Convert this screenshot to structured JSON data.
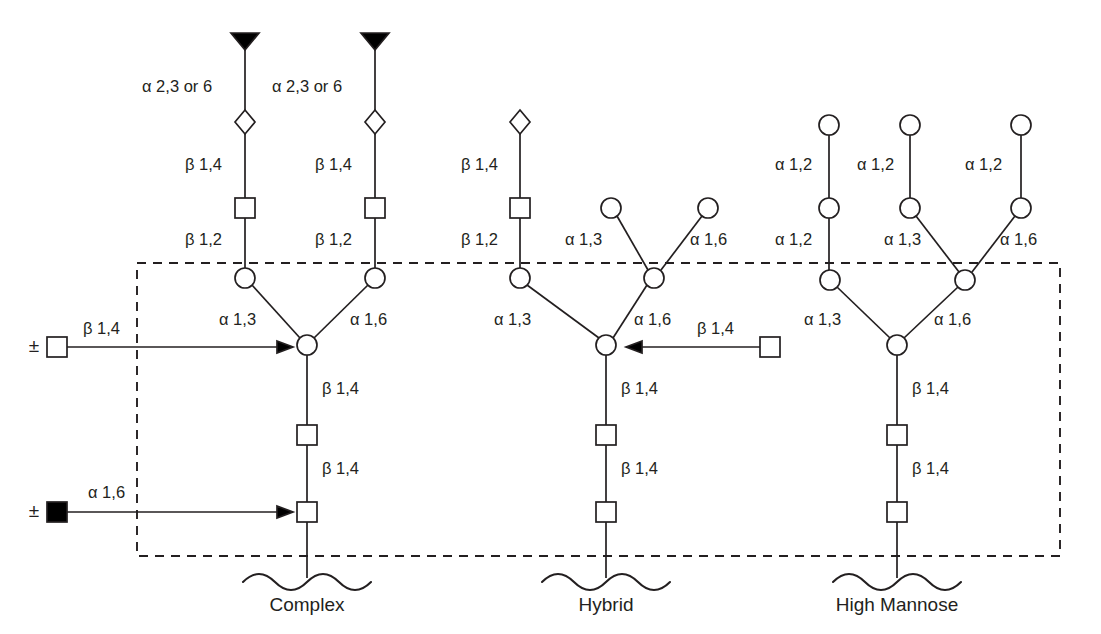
{
  "figure": {
    "background_color": "#ffffff",
    "line_color": "#231f20",
    "width": 1101,
    "height": 634
  },
  "legend_shapes": {
    "filled_triangle": "sialic-acid",
    "open_diamond": "galactose",
    "open_square": "n-acetylglucosamine",
    "filled_square": "fucose",
    "open_circle": "mannose"
  },
  "core_region": {
    "name": "common-core-dashed-box",
    "x": 137,
    "y": 263,
    "width": 923,
    "height": 293
  },
  "modifiers": [
    {
      "id": "bisecting-glcnac",
      "plusminus": "±",
      "shape": "open-square",
      "label": "β 1,4",
      "direction": "right"
    },
    {
      "id": "core-fucose",
      "plusminus": "±",
      "shape": "filled-square",
      "label": "α 1,6",
      "direction": "right"
    },
    {
      "id": "hybrid-bisecting-glcnac",
      "plusminus": "",
      "shape": "open-square",
      "label": "β 1,4",
      "direction": "left"
    }
  ],
  "structures": [
    {
      "id": "complex",
      "caption": "Complex",
      "caption_x": 307,
      "labels": [
        "α 2,3 or 6",
        "α 2,3 or 6",
        "β 1,4",
        "β 1,4",
        "β 1,2",
        "β 1,2",
        "α 1,3",
        "α 1,6",
        "β 1,4",
        "β 1,4"
      ]
    },
    {
      "id": "hybrid",
      "caption": "Hybrid",
      "caption_x": 606,
      "labels": [
        "β 1,4",
        "β 1,2",
        "α 1,3",
        "α 1,6",
        "α 1,3",
        "α 1,6",
        "β 1,4",
        "β 1,4",
        "β 1,4"
      ]
    },
    {
      "id": "high-mannose",
      "caption": "High Mannose",
      "caption_x": 897,
      "labels": [
        "α 1,2",
        "α 1,2",
        "α 1,2",
        "α 1,2",
        "α 1,3",
        "α 1,6",
        "α 1,3",
        "α 1,6",
        "β 1,4",
        "β 1,4"
      ]
    }
  ],
  "bond_labels": {
    "complex_sia_left": "α 2,3 or 6",
    "complex_sia_right": "α 2,3 or 6",
    "complex_gal_left": "β 1,4",
    "complex_gal_right": "β 1,4",
    "complex_glcnac_left": "β 1,2",
    "complex_glcnac_right": "β 1,2",
    "complex_man_a13": "α 1,3",
    "complex_man_a16": "α 1,6",
    "complex_core_b14_upper": "β 1,4",
    "complex_core_b14_lower": "β 1,4",
    "complex_bisect_b14": "β 1,4",
    "complex_fuc_a16": "α 1,6",
    "hybrid_gal_b14": "β 1,4",
    "hybrid_glcnac_b12": "β 1,2",
    "hybrid_upper_a13": "α 1,3",
    "hybrid_upper_a16": "α 1,6",
    "hybrid_man_a13": "α 1,3",
    "hybrid_man_a16": "α 1,6",
    "hybrid_bisect_b14": "β 1,4",
    "hybrid_core_b14_upper": "β 1,4",
    "hybrid_core_b14_lower": "β 1,4",
    "hm_a12_left": "α 1,2",
    "hm_a12_mid": "α 1,2",
    "hm_a12_right": "α 1,2",
    "hm_a12_left_lower": "α 1,2",
    "hm_a13_upper": "α 1,3",
    "hm_a16_upper": "α 1,6",
    "hm_a13_lower": "α 1,3",
    "hm_a16_lower": "α 1,6",
    "hm_core_b14_upper": "β 1,4",
    "hm_core_b14_lower": "β 1,4",
    "pm_bisect": "±",
    "pm_fucose": "±"
  }
}
